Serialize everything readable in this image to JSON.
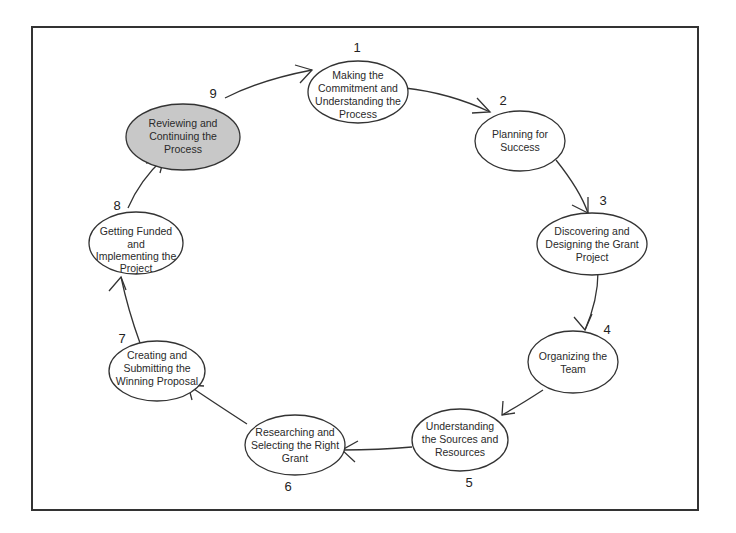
{
  "diagram": {
    "type": "cycle",
    "colors": {
      "frame": "#333333",
      "stroke": "#333333",
      "highlight_fill": "#c8c8c8",
      "node_fill": "#ffffff"
    },
    "steps": [
      {
        "number": "1",
        "lines": [
          "Making the",
          "Commitment and",
          "Understanding the",
          "Process"
        ],
        "highlighted": false
      },
      {
        "number": "2",
        "lines": [
          "Planning for",
          "Success"
        ],
        "highlighted": false
      },
      {
        "number": "3",
        "lines": [
          "Discovering and",
          "Designing the Grant",
          "Project"
        ],
        "highlighted": false
      },
      {
        "number": "4",
        "lines": [
          "Organizing the",
          "Team"
        ],
        "highlighted": false
      },
      {
        "number": "5",
        "lines": [
          "Understanding",
          "the Sources and",
          "Resources"
        ],
        "highlighted": false
      },
      {
        "number": "6",
        "lines": [
          "Researching and",
          "Selecting the Right",
          "Grant"
        ],
        "highlighted": false
      },
      {
        "number": "7",
        "lines": [
          "Creating and",
          "Submitting the",
          "Winning Proposal"
        ],
        "highlighted": false
      },
      {
        "number": "8",
        "lines": [
          "Getting Funded",
          "and",
          "Implementing the",
          "Project"
        ],
        "highlighted": false
      },
      {
        "number": "9",
        "lines": [
          "Reviewing and",
          "Continuing the",
          "Process"
        ],
        "highlighted": true
      }
    ]
  }
}
